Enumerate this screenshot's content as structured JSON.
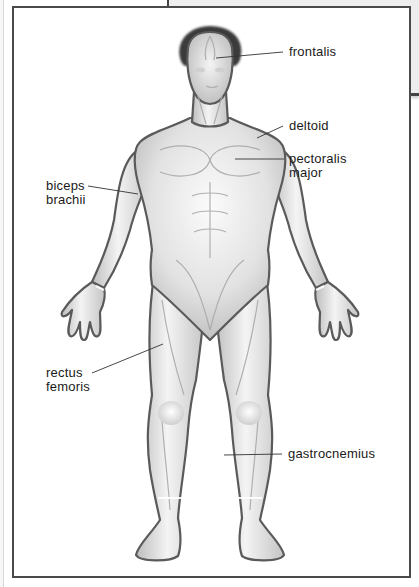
{
  "diagram": {
    "type": "anatomy-labeled-figure",
    "colors": {
      "frame": "#4a4a4a",
      "skin_light": "#f2f2f2",
      "skin_mid": "#c9c9c9",
      "outline": "#5a5a5a",
      "hair": "#3a3a3a",
      "leader_line": "#333333",
      "label_text": "#1a1a1a"
    },
    "labels": [
      {
        "id": "frontalis",
        "lines": [
          "frontalis"
        ],
        "side": "right"
      },
      {
        "id": "deltoid",
        "lines": [
          "deltoid"
        ],
        "side": "right"
      },
      {
        "id": "pectoralis-major",
        "lines": [
          "pectoralis",
          "major"
        ],
        "side": "right"
      },
      {
        "id": "biceps-brachii",
        "lines": [
          "biceps",
          "brachii"
        ],
        "side": "left"
      },
      {
        "id": "rectus-femoris",
        "lines": [
          "rectus",
          "femoris"
        ],
        "side": "left"
      },
      {
        "id": "gastrocnemius",
        "lines": [
          "gastrocnemius"
        ],
        "side": "right"
      }
    ]
  }
}
